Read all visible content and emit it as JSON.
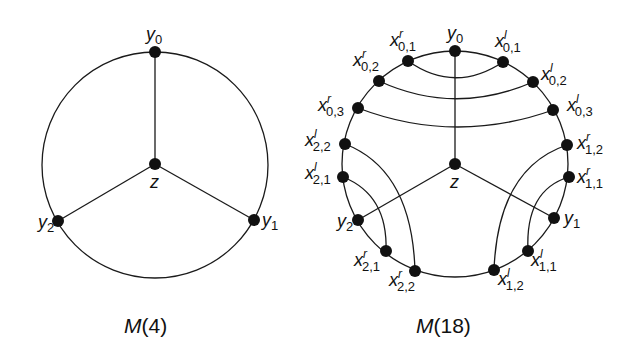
{
  "diagrams": [
    {
      "caption": "M(4)",
      "caption_main": "M",
      "caption_arg": "(4)",
      "center": [
        155,
        165
      ],
      "radius": 113,
      "vertices": [
        {
          "id": "y0",
          "base": "y",
          "sub": "0",
          "sup": "",
          "x": 155,
          "y": 52
        },
        {
          "id": "z",
          "base": "z",
          "sub": "",
          "sup": "",
          "x": 155,
          "y": 164
        },
        {
          "id": "y1",
          "base": "y",
          "sub": "1",
          "sup": "",
          "x": 254,
          "y": 220
        },
        {
          "id": "y2",
          "base": "y",
          "sub": "2",
          "sup": "",
          "x": 58,
          "y": 221
        }
      ]
    },
    {
      "caption": "M(18)",
      "caption_main": "M",
      "caption_arg": "(18)",
      "center": [
        455,
        164
      ],
      "radius": 113,
      "vertices": [
        {
          "id": "y0",
          "base": "y",
          "sub": "0",
          "sup": ""
        },
        {
          "id": "x01r",
          "base": "x",
          "sub": "0,1",
          "sup": "r"
        },
        {
          "id": "x01l",
          "base": "x",
          "sub": "0,1",
          "sup": "l"
        },
        {
          "id": "x02r",
          "base": "x",
          "sub": "0,2",
          "sup": "r"
        },
        {
          "id": "x02l",
          "base": "x",
          "sub": "0,2",
          "sup": "l"
        },
        {
          "id": "x03r",
          "base": "x",
          "sub": "0,3",
          "sup": "r"
        },
        {
          "id": "x03l",
          "base": "x",
          "sub": "0,3",
          "sup": "l"
        },
        {
          "id": "x12r",
          "base": "x",
          "sub": "1,2",
          "sup": "r"
        },
        {
          "id": "x11r",
          "base": "x",
          "sub": "1,1",
          "sup": "r"
        },
        {
          "id": "y1",
          "base": "y",
          "sub": "1",
          "sup": ""
        },
        {
          "id": "x11l",
          "base": "x",
          "sub": "1,1",
          "sup": "l"
        },
        {
          "id": "x12l",
          "base": "x",
          "sub": "1,2",
          "sup": "l"
        },
        {
          "id": "x22l",
          "base": "x",
          "sub": "2,2",
          "sup": "l"
        },
        {
          "id": "x21l",
          "base": "x",
          "sub": "2,1",
          "sup": "l"
        },
        {
          "id": "y2",
          "base": "y",
          "sub": "2",
          "sup": ""
        },
        {
          "id": "x21r",
          "base": "x",
          "sub": "2,1",
          "sup": "r"
        },
        {
          "id": "x22r",
          "base": "x",
          "sub": "2,2",
          "sup": "r"
        },
        {
          "id": "z",
          "base": "z",
          "sub": "",
          "sup": ""
        }
      ]
    }
  ]
}
